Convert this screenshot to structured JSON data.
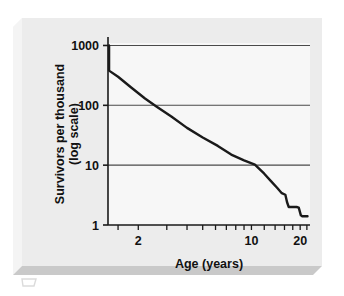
{
  "figure": {
    "panel_bg": "#ececec",
    "plot_bg": "#f7f7f7",
    "bevel_light": "#fbfbfb",
    "bevel_shadow": "#c9c9c9",
    "axis_color": "#1a1a1a",
    "grid_color": "#4a4a4a",
    "curve_color": "#1a1a1a",
    "text_color": "#111111"
  },
  "chart_data": {
    "type": "line",
    "title": "",
    "xlabel": "Age (years)",
    "ylabel": "Survivors per thousand (log scale)",
    "ylabel_line1": "Survivors per thousand",
    "ylabel_line2": "(log scale)",
    "xscale": "log",
    "yscale": "log",
    "xlim": [
      1.3,
      23
    ],
    "ylim": [
      1,
      1100
    ],
    "grid": "horizontal",
    "legend": "none",
    "ytick_labels": [
      "1000",
      "100",
      "10",
      "1"
    ],
    "ytick_values": [
      1000,
      100,
      10,
      1
    ],
    "ygrid_values": [
      1000,
      100,
      10
    ],
    "xtick_labels": [
      "2",
      "10",
      "20"
    ],
    "xtick_values": [
      2,
      10,
      20
    ],
    "xminor_ticks": [
      1.5,
      2,
      3,
      4,
      5,
      6,
      7,
      8,
      9,
      10,
      12,
      14,
      16,
      18,
      20,
      22
    ],
    "series": [
      {
        "name": "survivorship",
        "x": [
          1.32,
          1.32,
          1.5,
          1.8,
          2.2,
          2.6,
          3.2,
          4.0,
          5.0,
          6.2,
          7.5,
          9.0,
          10.5,
          12.0,
          13.2,
          14.4,
          15.4,
          16.2,
          16.6,
          17.0,
          18.6,
          19.0,
          19.6,
          20.2,
          20.6,
          22.2
        ],
        "y": [
          1000,
          380,
          300,
          200,
          130,
          95,
          65,
          42,
          29,
          21,
          15,
          12,
          10.2,
          7.2,
          5.4,
          4.2,
          3.4,
          3.2,
          2.4,
          2.0,
          2.0,
          2.0,
          1.95,
          1.45,
          1.4,
          1.4
        ]
      }
    ]
  }
}
